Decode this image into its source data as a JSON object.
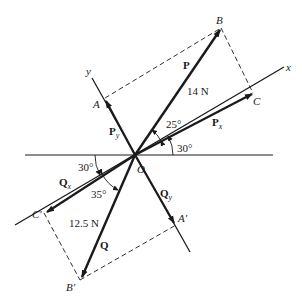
{
  "diagram": {
    "points": {
      "origin": "O",
      "B": "B",
      "A": "A",
      "C": "C",
      "B_prime": "B′",
      "A_prime": "A′",
      "C_prime": "C′"
    },
    "axes": {
      "x": "x",
      "y": "y"
    },
    "vectors": {
      "P": "P",
      "P_magnitude": "14 N",
      "Px": "P",
      "Px_sub": "x",
      "Py": "P",
      "Py_sub": "y",
      "Q": "Q",
      "Q_magnitude": "12.5 N",
      "Qx": "Q",
      "Qx_sub": "x",
      "Qy": "Q",
      "Qy_sub": "y"
    },
    "angles": {
      "P_to_x": "25°",
      "x_to_horizontal": "30°",
      "horizontal_to_negx": "30°",
      "Q_to_negx": "35°"
    },
    "colors": {
      "line": "#1a1a1a",
      "background": "#ffffff"
    }
  }
}
